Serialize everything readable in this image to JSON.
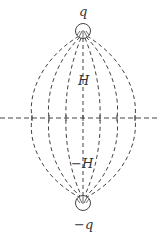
{
  "diagram": {
    "top_charge_label": "q",
    "bottom_charge_label": "−q",
    "upper_label": "H",
    "lower_label": "−H",
    "stroke_color": "#444444"
  }
}
